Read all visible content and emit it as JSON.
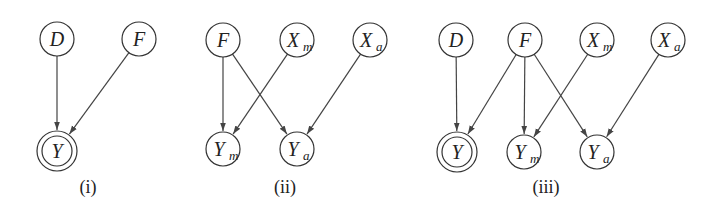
{
  "colors": {
    "stroke": "#333333",
    "text": "#222222",
    "background": "#ffffff"
  },
  "graphs": [
    {
      "caption": "(i)",
      "caption_pos": [
        88,
        193
      ],
      "nodes": [
        {
          "id": "D",
          "label": "D",
          "sub": "",
          "x": 57,
          "y": 39,
          "double": false
        },
        {
          "id": "F",
          "label": "F",
          "sub": "",
          "x": 139,
          "y": 39,
          "double": false
        },
        {
          "id": "Y",
          "label": "Y",
          "sub": "",
          "x": 57,
          "y": 151,
          "double": true
        }
      ],
      "edges": [
        [
          "D",
          "Y"
        ],
        [
          "F",
          "Y"
        ]
      ]
    },
    {
      "caption": "(ii)",
      "caption_pos": [
        285,
        193
      ],
      "nodes": [
        {
          "id": "F",
          "label": "F",
          "sub": "",
          "x": 223,
          "y": 40,
          "double": false
        },
        {
          "id": "Xm",
          "label": "X",
          "sub": "m",
          "x": 297,
          "y": 40,
          "double": false
        },
        {
          "id": "Xa",
          "label": "X",
          "sub": "a",
          "x": 370,
          "y": 40,
          "double": false
        },
        {
          "id": "Ym",
          "label": "Y",
          "sub": "m",
          "x": 223,
          "y": 149,
          "double": false
        },
        {
          "id": "Ya",
          "label": "Y",
          "sub": "a",
          "x": 297,
          "y": 149,
          "double": false
        }
      ],
      "edges": [
        [
          "F",
          "Ym"
        ],
        [
          "F",
          "Ya"
        ],
        [
          "Xm",
          "Ym"
        ],
        [
          "Xa",
          "Ya"
        ]
      ]
    },
    {
      "caption": "(iii)",
      "caption_pos": [
        546,
        193
      ],
      "nodes": [
        {
          "id": "D",
          "label": "D",
          "sub": "",
          "x": 456,
          "y": 40,
          "double": false
        },
        {
          "id": "F",
          "label": "F",
          "sub": "",
          "x": 525,
          "y": 40,
          "double": false
        },
        {
          "id": "Xm",
          "label": "X",
          "sub": "m",
          "x": 597,
          "y": 40,
          "double": false
        },
        {
          "id": "Xa",
          "label": "X",
          "sub": "a",
          "x": 668,
          "y": 40,
          "double": false
        },
        {
          "id": "Y",
          "label": "Y",
          "sub": "",
          "x": 457,
          "y": 152,
          "double": true
        },
        {
          "id": "Ym",
          "label": "Y",
          "sub": "m",
          "x": 524,
          "y": 152,
          "double": false
        },
        {
          "id": "Ya",
          "label": "Y",
          "sub": "a",
          "x": 597,
          "y": 152,
          "double": false
        }
      ],
      "edges": [
        [
          "D",
          "Y"
        ],
        [
          "F",
          "Y"
        ],
        [
          "F",
          "Ym"
        ],
        [
          "F",
          "Ya"
        ],
        [
          "Xm",
          "Ym"
        ],
        [
          "Xa",
          "Ya"
        ]
      ]
    }
  ]
}
